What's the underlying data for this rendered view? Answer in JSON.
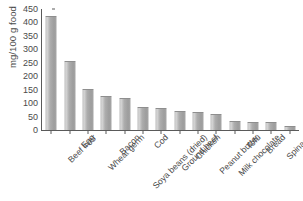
{
  "chart_data": {
    "type": "bar",
    "title": "",
    "xlabel": "",
    "ylabel": "mg/100 g food",
    "ylim": [
      0,
      450
    ],
    "ytick_values": [
      0,
      50,
      100,
      150,
      200,
      250,
      300,
      350,
      400,
      450
    ],
    "ytick_labels": [
      "0",
      "50",
      "100",
      "150",
      "200",
      "250",
      "300",
      "350",
      "400",
      "450"
    ],
    "grid": false,
    "legend": false,
    "bar_color": "#aaaaaa",
    "axis_color": "#5a5a5a",
    "text_color": "#4a4a4a",
    "categories": [
      "Beef liver",
      "Egg",
      "Wheat germ",
      "Bacon",
      "Soya beans (dried)",
      "Cod",
      "Ground beef",
      "Chicken",
      "Peanut butter",
      "Milk chocolate",
      "Tofu",
      "Bread",
      "Spinach",
      "Cows' milk"
    ],
    "values": [
      423,
      255,
      152,
      128,
      120,
      84,
      82,
      70,
      68,
      60,
      34,
      28,
      28,
      16
    ]
  }
}
